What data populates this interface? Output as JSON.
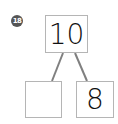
{
  "problem": {
    "number": "18",
    "whole": "10",
    "part_left": "",
    "part_right": "8"
  },
  "colors": {
    "badge": "#555555",
    "box_border": "#b5b5b5",
    "line": "#808080"
  }
}
